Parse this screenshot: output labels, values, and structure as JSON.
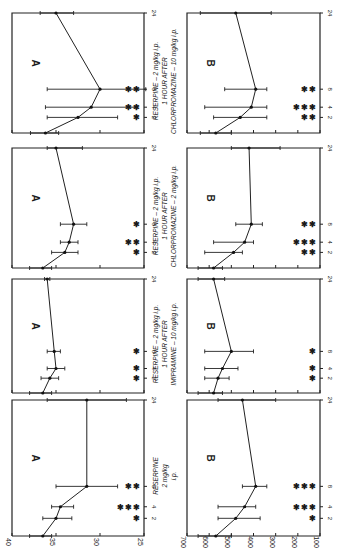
{
  "figure": {
    "orientation": "rotated 90 degrees clockwise",
    "panel_letter_a": "A",
    "panel_letter_b": "B"
  },
  "chart_data": [
    {
      "type": "line",
      "id": "A1",
      "panel": "A",
      "title": "RESERPINE - 2 mg/kg i.p. 1 HOUR AFTER CHLORPROMAZINE - 10 mg/kg i.p.",
      "xlabel": "hours",
      "x_ticks": [
        2,
        4,
        8,
        24
      ],
      "ylim": [
        25,
        40
      ],
      "y_ticks": [
        25,
        30,
        35,
        40
      ],
      "x": [
        0,
        2,
        4,
        8,
        24
      ],
      "values": [
        36.2,
        32.5,
        31.0,
        30.0,
        35.0
      ],
      "error": [
        [
          37.9,
          34.7
        ],
        [
          36.0,
          28.0
        ],
        [
          36.2,
          25.8
        ],
        [
          36.0,
          24.8
        ],
        [
          36.8,
          33.0
        ]
      ],
      "stars": {
        "2": 1,
        "4": 2,
        "8": 2
      }
    },
    {
      "type": "line",
      "id": "A2",
      "panel": "A",
      "title": "RESERPINE - 2 mg/kg i.p. 1 HOUR AFTER CHLORPROMAZINE - 2 mg/kg i.p.",
      "xlabel": "hours",
      "x_ticks": [
        2,
        4,
        8,
        24
      ],
      "ylim": [
        25,
        40
      ],
      "y_ticks": [
        25,
        30,
        35,
        40
      ],
      "x": [
        0,
        2,
        4,
        8,
        24
      ],
      "values": [
        36.5,
        34.0,
        33.5,
        33.0,
        35.0
      ],
      "error": [
        [
          38.0,
          35.5
        ],
        [
          35.5,
          32.5
        ],
        [
          34.5,
          32.5
        ],
        [
          34.5,
          31.5
        ],
        [
          36.0,
          32.0
        ]
      ],
      "stars": {
        "2": 1,
        "4": 2,
        "8": 1
      }
    },
    {
      "type": "line",
      "id": "A3",
      "panel": "A",
      "title": "RESERPINE - 2 mg/kg i.p. 1 HOUR AFTER IMIPRAMINE - 10 mg/kg i.p.",
      "xlabel": "hours",
      "x_ticks": [
        2,
        4,
        8,
        24
      ],
      "ylim": [
        25,
        40
      ],
      "y_ticks": [
        25,
        30,
        35,
        40
      ],
      "x": [
        0,
        2,
        4,
        8,
        24
      ],
      "values": [
        36.5,
        35.7,
        35.0,
        35.2,
        36.0
      ],
      "error": [
        [
          38.0,
          35.5
        ],
        [
          36.7,
          34.7
        ],
        [
          36.0,
          34.0
        ],
        [
          36.0,
          34.5
        ],
        [
          36.3,
          35.7
        ]
      ],
      "stars": {
        "2": 1,
        "4": 1,
        "8": 1
      }
    },
    {
      "type": "line",
      "id": "A4",
      "panel": "A",
      "title": "RESERPINE 2 mg/kg i.p.",
      "xlabel": "hours",
      "x_ticks": [
        2,
        4,
        8,
        24
      ],
      "ylim": [
        25,
        40
      ],
      "y_ticks": [
        25,
        30,
        35,
        40
      ],
      "x": [
        0,
        2,
        4,
        8,
        24
      ],
      "values": [
        36.5,
        35.0,
        34.5,
        31.5,
        31.5
      ],
      "error": [
        [
          38.0,
          35.5
        ],
        [
          36.5,
          33.2
        ],
        [
          35.5,
          33.0
        ],
        [
          35.0,
          28.0
        ],
        [
          36.0,
          27.0
        ]
      ],
      "stars": {
        "2": 1,
        "4": 3,
        "8": 2
      }
    },
    {
      "type": "line",
      "id": "B1",
      "panel": "B",
      "title": "RESERPINE - 2 mg/kg i.p. 1 HOUR AFTER CHLORPROMAZINE - 10 mg/kg i.p.",
      "xlabel": "hours",
      "x_ticks": [
        2,
        4,
        8,
        24
      ],
      "ylim": [
        100,
        700
      ],
      "y_ticks": [
        100,
        200,
        300,
        400,
        500,
        600,
        700
      ],
      "x": [
        0,
        2,
        4,
        8,
        24
      ],
      "values": [
        570,
        460,
        410,
        390,
        480
      ],
      "error": [
        [
          640,
          500
        ],
        [
          580,
          340
        ],
        [
          620,
          340
        ],
        [
          530,
          340
        ],
        [
          640,
          320
        ]
      ],
      "stars": {
        "2": 2,
        "4": 3,
        "8": 2
      }
    },
    {
      "type": "line",
      "id": "B2",
      "panel": "B",
      "title": "RESERPINE - 2 mg/kg i.p. 1 HOUR AFTER CHLORPROMAZINE - 2 mg/kg i.p.",
      "xlabel": "hours",
      "x_ticks": [
        2,
        4,
        8,
        24
      ],
      "ylim": [
        100,
        700
      ],
      "y_ticks": [
        100,
        200,
        300,
        400,
        500,
        600,
        700
      ],
      "x": [
        0,
        2,
        4,
        8,
        24
      ],
      "values": [
        580,
        490,
        440,
        410,
        420
      ],
      "error": [
        [
          650,
          540
        ],
        [
          620,
          450
        ],
        [
          580,
          400
        ],
        [
          480,
          360
        ],
        [
          500,
          280
        ]
      ],
      "stars": {
        "2": 2,
        "4": 3,
        "8": 2
      }
    },
    {
      "type": "line",
      "id": "B3",
      "panel": "B",
      "title": "RESERPINE - 2 mg/kg i.p. 1 HOUR AFTER IMIPRAMINE - 10 mg/kg i.p.",
      "xlabel": "hours",
      "x_ticks": [
        2,
        4,
        8,
        24
      ],
      "ylim": [
        100,
        700
      ],
      "y_ticks": [
        100,
        200,
        300,
        400,
        500,
        600,
        700
      ],
      "x": [
        0,
        2,
        4,
        8,
        24
      ],
      "values": [
        580,
        560,
        540,
        500,
        580
      ],
      "error": [
        [
          650,
          540
        ],
        [
          620,
          510
        ],
        [
          620,
          470
        ],
        [
          620,
          400
        ],
        [
          650,
          530
        ]
      ],
      "stars": {
        "2": 1,
        "4": 1,
        "8": 1
      }
    },
    {
      "type": "line",
      "id": "B4",
      "panel": "B",
      "title": "RESERPINE 2 mg/kg i.p.",
      "xlabel": "hours",
      "x_ticks": [
        2,
        4,
        8,
        24
      ],
      "ylim": [
        100,
        700
      ],
      "y_ticks": [
        100,
        200,
        300,
        400,
        500,
        600,
        700
      ],
      "x": [
        0,
        2,
        4,
        8,
        24
      ],
      "values": [
        570,
        480,
        440,
        390,
        450
      ],
      "error": [
        [
          650,
          500
        ],
        [
          560,
          370
        ],
        [
          560,
          390
        ],
        [
          450,
          340
        ],
        [
          560,
          300
        ]
      ],
      "stars": {
        "2": 1,
        "4": 3,
        "8": 3
      }
    }
  ],
  "axis_labels": {
    "a_ticks": [
      "40",
      "35",
      "30",
      "25"
    ],
    "b_ticks": [
      "700",
      "600",
      "500",
      "400",
      "300",
      "200",
      "100"
    ],
    "hour_ticks": [
      "2",
      "4",
      "8",
      "24"
    ]
  },
  "captions": {
    "row1": [
      "RESERPINE – 2 mg/kg i.p.",
      "1 HOUR AFTER",
      "CHLORPROMAZINE – 10 mg/kg i.p."
    ],
    "row2": [
      "RESERPINE – 2 mg/kg i.p.",
      "1 HOUR AFTER",
      "CHLORPROMAZINE – 2 mg/kg i.p."
    ],
    "row3": [
      "RESERPINE – 2 mg/kg i.p.",
      "1 HOUR AFTER",
      "IMIPRAMINE – 10 mg/kg i.p."
    ],
    "row4": [
      "RESERPINE",
      "2 mg/kg",
      "i.p."
    ]
  }
}
